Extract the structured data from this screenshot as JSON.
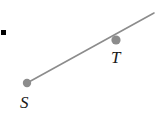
{
  "figure": {
    "type": "geometry-ray-diagram",
    "width": 160,
    "height": 119,
    "background_color": "#ffffff",
    "bullet_marker": {
      "name": "list-bullet-square",
      "color": "#000000",
      "x": 1,
      "y": 30,
      "size": 5
    },
    "ray": {
      "name": "ray-ST",
      "color": "#8c8c8c",
      "stroke_width": 1.6,
      "start": {
        "x": 27,
        "y": 83
      },
      "end": {
        "x": 154,
        "y": 13
      }
    },
    "points": [
      {
        "id": "S",
        "label": "S",
        "color": "#8c8c8c",
        "radius": 4.2,
        "x": 27,
        "y": 83,
        "label_x": 20,
        "label_y": 94
      },
      {
        "id": "T",
        "label": "T",
        "color": "#8c8c8c",
        "radius": 4.6,
        "x": 116,
        "y": 40,
        "label_x": 111,
        "label_y": 49
      }
    ]
  }
}
